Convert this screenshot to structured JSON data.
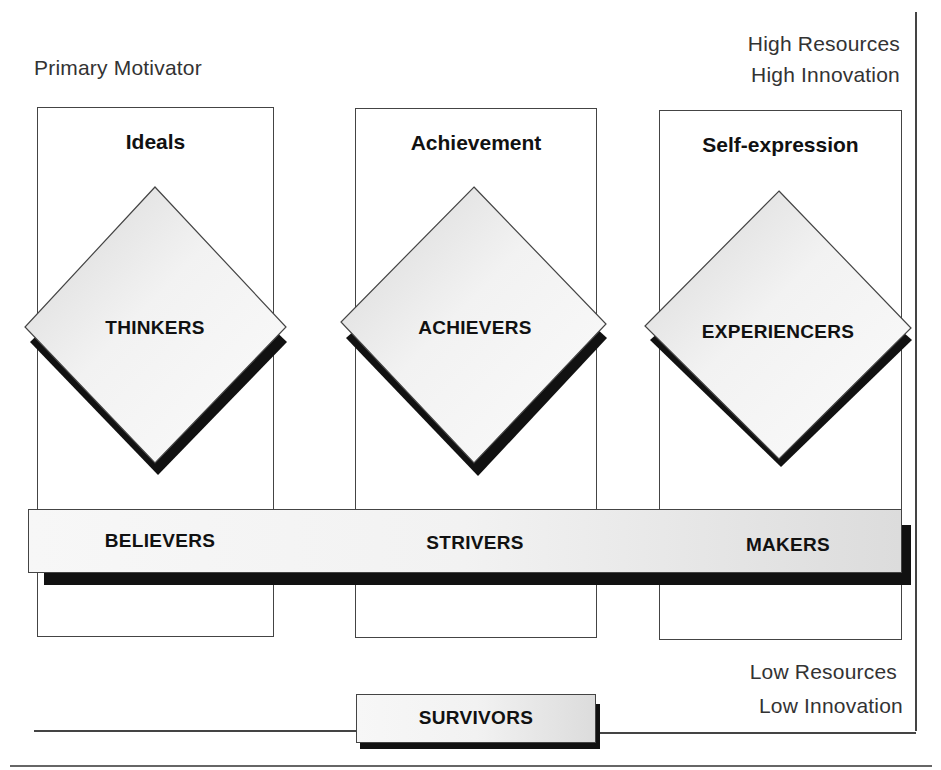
{
  "diagram": {
    "axis_label_top_left": "Primary Motivator",
    "top_right_label": {
      "line1": "High Resources",
      "line2": "High Innovation"
    },
    "bottom_right_label": {
      "line1": "Low Resources",
      "line2": "Low Innovation"
    },
    "columns": [
      {
        "title": "Ideals",
        "high_segment": "THINKERS",
        "low_segment": "BELIEVERS"
      },
      {
        "title": "Achievement",
        "high_segment": "ACHIEVERS",
        "low_segment": "STRIVERS"
      },
      {
        "title": "Self-expression",
        "high_segment": "EXPERIENCERS",
        "low_segment": "MAKERS"
      }
    ],
    "base_segment": "SURVIVORS",
    "colors": {
      "line": "#444444",
      "shadow": "#111111",
      "fill_light": "#f4f4f4",
      "fill_dark": "#d8d8d8"
    }
  }
}
